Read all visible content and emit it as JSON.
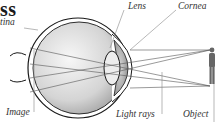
{
  "title": "ss",
  "labels": {
    "retina": "tina",
    "lens": "Lens",
    "cornea": "Cornea",
    "image": "Image",
    "light_rays": "Light rays",
    "object": "Object"
  },
  "colors": {
    "outline": "#1a1a1a",
    "ray": "#555555",
    "leader": "#888888",
    "eye_fill": "#d9d9d9",
    "lens_fill": "#bcbcbc",
    "figure": "#666666"
  }
}
